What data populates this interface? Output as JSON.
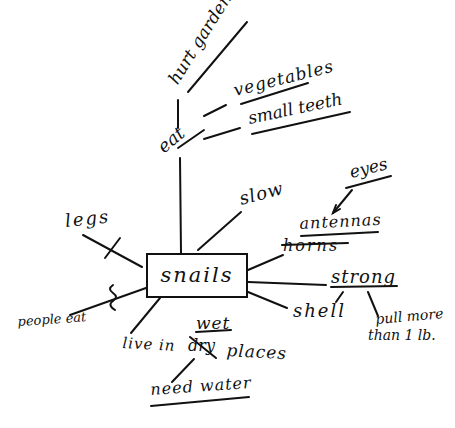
{
  "diagram": {
    "type": "concept-map",
    "style": "hand-drawn",
    "center": {
      "label": "snails"
    },
    "nodes": {
      "hurt_gardens": "hurt gardens",
      "eat": "eat",
      "vegetables": "vegetables",
      "small_teeth": "small teeth",
      "slow": "slow",
      "eyes": "eyes",
      "antennas": "antennas",
      "horns": "horns",
      "legs": "legs",
      "strong": "strong",
      "shell": "shell",
      "pull_more": "pull more",
      "than_1lb": "than 1 lb.",
      "people_eat": "people eat",
      "live_in": "live in",
      "dry": "dry",
      "wet": "wet",
      "places": "places",
      "need_water": "need water"
    },
    "edits": {
      "crossed_out": [
        "legs",
        "horns",
        "dry"
      ],
      "replacements": [
        {
          "from": "horns",
          "to": "antennas"
        },
        {
          "from": "dry",
          "to": "wet"
        }
      ]
    },
    "connections": [
      [
        "snails",
        "eat"
      ],
      [
        "eat",
        "hurt gardens"
      ],
      [
        "eat",
        "vegetables"
      ],
      [
        "eat",
        "small teeth"
      ],
      [
        "snails",
        "slow"
      ],
      [
        "snails",
        "horns"
      ],
      [
        "eyes",
        "antennas"
      ],
      [
        "snails",
        "strong"
      ],
      [
        "strong",
        "shell"
      ],
      [
        "strong",
        "pull more than 1 lb."
      ],
      [
        "snails",
        "shell"
      ],
      [
        "snails",
        "legs"
      ],
      [
        "snails",
        "people eat"
      ],
      [
        "snails",
        "live in wet places"
      ],
      [
        "live in wet places",
        "need water"
      ]
    ]
  }
}
